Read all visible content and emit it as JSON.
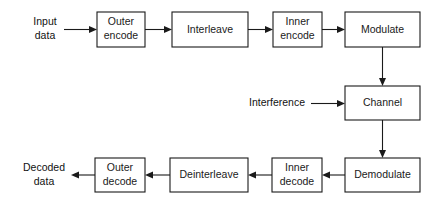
{
  "diagram": {
    "type": "block-flow-diagram",
    "colors": {
      "background": "#ffffff",
      "stroke": "#1a1a1a",
      "box_fill": "#ffffff",
      "text": "#1a1a1a"
    },
    "blocks": [
      {
        "id": "outer-encode",
        "line1": "Outer",
        "line2": "encode",
        "x": 97,
        "y": 12,
        "w": 48,
        "h": 35
      },
      {
        "id": "interleave",
        "line1": "Interleave",
        "line2": "",
        "x": 172,
        "y": 12,
        "w": 76,
        "h": 35
      },
      {
        "id": "inner-encode",
        "line1": "Inner",
        "line2": "encode",
        "x": 273,
        "y": 12,
        "w": 49,
        "h": 35
      },
      {
        "id": "modulate",
        "line1": "Modulate",
        "line2": "",
        "x": 345,
        "y": 12,
        "w": 75,
        "h": 35
      },
      {
        "id": "channel",
        "line1": "Channel",
        "line2": "",
        "x": 345,
        "y": 86,
        "w": 75,
        "h": 34
      },
      {
        "id": "demodulate",
        "line1": "Demodulate",
        "line2": "",
        "x": 345,
        "y": 158,
        "w": 75,
        "h": 34
      },
      {
        "id": "inner-decode",
        "line1": "Inner",
        "line2": "decode",
        "x": 272,
        "y": 158,
        "w": 50,
        "h": 34
      },
      {
        "id": "deinterleave",
        "line1": "Deinterleave",
        "line2": "",
        "x": 170,
        "y": 158,
        "w": 78,
        "h": 34
      },
      {
        "id": "outer-decode",
        "line1": "Outer",
        "line2": "decode",
        "x": 95,
        "y": 158,
        "w": 50,
        "h": 34
      }
    ],
    "labels": [
      {
        "id": "input-data",
        "line1": "Input",
        "line2": "data",
        "cx": 45,
        "cy": 29
      },
      {
        "id": "decoded-data",
        "line1": "Decoded",
        "line2": "data",
        "cx": 44,
        "cy": 175
      },
      {
        "id": "interference",
        "line1": "Interference",
        "line2": "",
        "cx": 277,
        "cy": 103
      }
    ],
    "connections": [
      {
        "id": "input-to-outer-encode",
        "from": "input data",
        "to": "Outer encode"
      },
      {
        "id": "outer-encode-to-interleave",
        "from": "Outer encode",
        "to": "Interleave"
      },
      {
        "id": "interleave-to-inner-encode",
        "from": "Interleave",
        "to": "Inner encode"
      },
      {
        "id": "inner-encode-to-modulate",
        "from": "Inner encode",
        "to": "Modulate"
      },
      {
        "id": "modulate-to-channel",
        "from": "Modulate",
        "to": "Channel"
      },
      {
        "id": "interference-to-channel",
        "from": "Interference",
        "to": "Channel"
      },
      {
        "id": "channel-to-demodulate",
        "from": "Channel",
        "to": "Demodulate"
      },
      {
        "id": "demodulate-to-inner-decode",
        "from": "Demodulate",
        "to": "Inner decode"
      },
      {
        "id": "inner-decode-to-deinterleave",
        "from": "Inner decode",
        "to": "Deinterleave"
      },
      {
        "id": "deinterleave-to-outer-decode",
        "from": "Deinterleave",
        "to": "Outer decode"
      },
      {
        "id": "outer-decode-to-output",
        "from": "Outer decode",
        "to": "Decoded data"
      }
    ]
  }
}
